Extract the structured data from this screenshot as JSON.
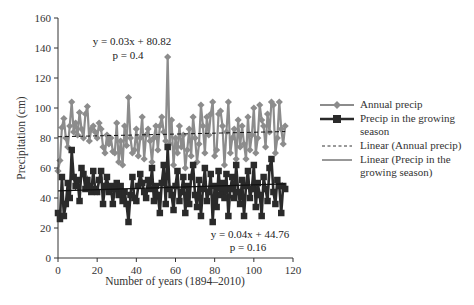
{
  "chart_data": {
    "type": "line",
    "title": "",
    "xlabel": "Number of years (1894–2010)",
    "ylabel": "Precipitation (cm)",
    "xlim": [
      0,
      120
    ],
    "ylim": [
      0,
      160
    ],
    "xticks": [
      0,
      20,
      40,
      60,
      80,
      100,
      120
    ],
    "yticks": [
      0,
      20,
      40,
      60,
      80,
      100,
      120,
      140,
      160
    ],
    "grid": false,
    "legend_position": "right",
    "series": [
      {
        "name": "Annual precip",
        "color": "#8c8c8c",
        "marker": "diamond",
        "x": [
          0,
          1,
          2,
          3,
          4,
          5,
          6,
          7,
          8,
          9,
          10,
          11,
          12,
          13,
          14,
          15,
          16,
          17,
          18,
          19,
          20,
          21,
          22,
          23,
          24,
          25,
          26,
          27,
          28,
          29,
          30,
          31,
          32,
          33,
          34,
          35,
          36,
          37,
          38,
          39,
          40,
          41,
          42,
          43,
          44,
          45,
          46,
          47,
          48,
          49,
          50,
          51,
          52,
          53,
          54,
          55,
          56,
          57,
          58,
          59,
          60,
          61,
          62,
          63,
          64,
          65,
          66,
          67,
          68,
          69,
          70,
          71,
          72,
          73,
          74,
          75,
          76,
          77,
          78,
          79,
          80,
          81,
          82,
          83,
          84,
          85,
          86,
          87,
          88,
          89,
          90,
          91,
          92,
          93,
          94,
          95,
          96,
          97,
          98,
          99,
          100,
          101,
          102,
          103,
          104,
          105,
          106,
          107,
          108,
          109,
          110,
          111,
          112,
          113,
          114,
          115,
          116
        ],
        "values": [
          58,
          65,
          87,
          93,
          80,
          74,
          88,
          104,
          84,
          90,
          82,
          97,
          86,
          80,
          96,
          101,
          78,
          86,
          88,
          84,
          80,
          90,
          86,
          74,
          70,
          82,
          76,
          80,
          71,
          70,
          90,
          64,
          78,
          62,
          88,
          75,
          107,
          80,
          70,
          72,
          86,
          68,
          80,
          94,
          66,
          82,
          86,
          78,
          64,
          80,
          88,
          72,
          88,
          94,
          84,
          78,
          134,
          76,
          92,
          62,
          80,
          70,
          88,
          74,
          82,
          60,
          72,
          86,
          68,
          94,
          80,
          64,
          76,
          102,
          88,
          70,
          94,
          82,
          96,
          104,
          68,
          72,
          96,
          98,
          88,
          62,
          84,
          104,
          70,
          80,
          86,
          66,
          92,
          74,
          88,
          76,
          66,
          94,
          72,
          82,
          100,
          70,
          80,
          102,
          92,
          88,
          74,
          96,
          84,
          104,
          102,
          70,
          80,
          104,
          86,
          76,
          88
        ],
        "trendline": {
          "name": "Linear (Annual precip)",
          "equation": "y = 0.03x + 80.82",
          "p": "p = 0.4",
          "slope": 0.03,
          "intercept": 80.82,
          "style": "dashed"
        }
      },
      {
        "name": "Precip in the growing season",
        "color": "#2a2a2a",
        "marker": "square",
        "x": [
          0,
          1,
          2,
          3,
          4,
          5,
          6,
          7,
          8,
          9,
          10,
          11,
          12,
          13,
          14,
          15,
          16,
          17,
          18,
          19,
          20,
          21,
          22,
          23,
          24,
          25,
          26,
          27,
          28,
          29,
          30,
          31,
          32,
          33,
          34,
          35,
          36,
          37,
          38,
          39,
          40,
          41,
          42,
          43,
          44,
          45,
          46,
          47,
          48,
          49,
          50,
          51,
          52,
          53,
          54,
          55,
          56,
          57,
          58,
          59,
          60,
          61,
          62,
          63,
          64,
          65,
          66,
          67,
          68,
          69,
          70,
          71,
          72,
          73,
          74,
          75,
          76,
          77,
          78,
          79,
          80,
          81,
          82,
          83,
          84,
          85,
          86,
          87,
          88,
          89,
          90,
          91,
          92,
          93,
          94,
          95,
          96,
          97,
          98,
          99,
          100,
          101,
          102,
          103,
          104,
          105,
          106,
          107,
          108,
          109,
          110,
          111,
          112,
          113,
          114,
          115,
          116
        ],
        "values": [
          30,
          26,
          54,
          28,
          36,
          50,
          40,
          72,
          54,
          48,
          52,
          38,
          60,
          56,
          46,
          52,
          48,
          44,
          58,
          46,
          44,
          52,
          58,
          36,
          48,
          54,
          44,
          48,
          36,
          46,
          50,
          42,
          48,
          38,
          44,
          36,
          24,
          42,
          54,
          40,
          38,
          48,
          56,
          50,
          44,
          40,
          52,
          46,
          60,
          38,
          48,
          42,
          30,
          50,
          62,
          36,
          74,
          46,
          42,
          32,
          48,
          58,
          38,
          44,
          54,
          30,
          48,
          36,
          54,
          62,
          42,
          34,
          52,
          28,
          46,
          60,
          38,
          44,
          56,
          24,
          48,
          34,
          58,
          42,
          50,
          40,
          56,
          28,
          46,
          54,
          40,
          62,
          44,
          36,
          52,
          28,
          48,
          58,
          40,
          46,
          62,
          34,
          50,
          42,
          28,
          54,
          46,
          38,
          60,
          66,
          44,
          36,
          52,
          48,
          30,
          48,
          46
        ],
        "trendline": {
          "name": "Linear (Precip in the growing season)",
          "equation": "y = 0.04x + 44.76",
          "p": "p = 0.16",
          "slope": 0.04,
          "intercept": 44.76,
          "style": "solid"
        }
      }
    ],
    "annotations": [
      {
        "text": "y = 0.03x + 80.82",
        "near": "top-left"
      },
      {
        "text": "p = 0.4",
        "near": "top-left"
      },
      {
        "text": "y = 0.04x + 44.76",
        "near": "bottom-right"
      },
      {
        "text": "p = 0.16",
        "near": "bottom-right"
      }
    ]
  },
  "legend": {
    "items": [
      {
        "label": "Annual precip"
      },
      {
        "label": "Precip in the growing season"
      },
      {
        "label": "Linear (Annual precip)"
      },
      {
        "label": "Linear (Precip in the growing season)"
      }
    ]
  },
  "annotation_text": {
    "annual_eq": "y = 0.03x + 80.82",
    "annual_p": "p = 0.4",
    "growing_eq": "y = 0.04x + 44.76",
    "growing_p": "p = 0.16"
  },
  "axes": {
    "xlabel": "Number of years (1894–2010)",
    "ylabel": "Precipitation (cm)"
  }
}
